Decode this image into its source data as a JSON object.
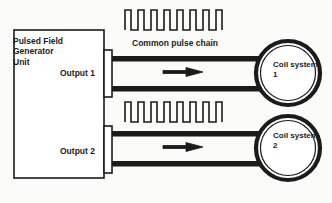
{
  "figure": {
    "background_color": "#fbfbf9",
    "stroke_color": "#1b1b1b"
  },
  "generator": {
    "title_line1": "Pulsed Field",
    "title_line2": "Generator",
    "title_line3": "Unit",
    "output1_label": "Output 1",
    "output2_label": "Output 2"
  },
  "pulse_chain": {
    "label": "Common pulse chain",
    "pulse_count": 8
  },
  "coils": [
    {
      "name_line1": "Coil system",
      "name_line2": "1"
    },
    {
      "name_line1": "Coil system",
      "name_line2": "2"
    }
  ],
  "channels": [
    {
      "direction_icon": "arrow-right-icon"
    },
    {
      "direction_icon": "arrow-right-icon"
    }
  ]
}
